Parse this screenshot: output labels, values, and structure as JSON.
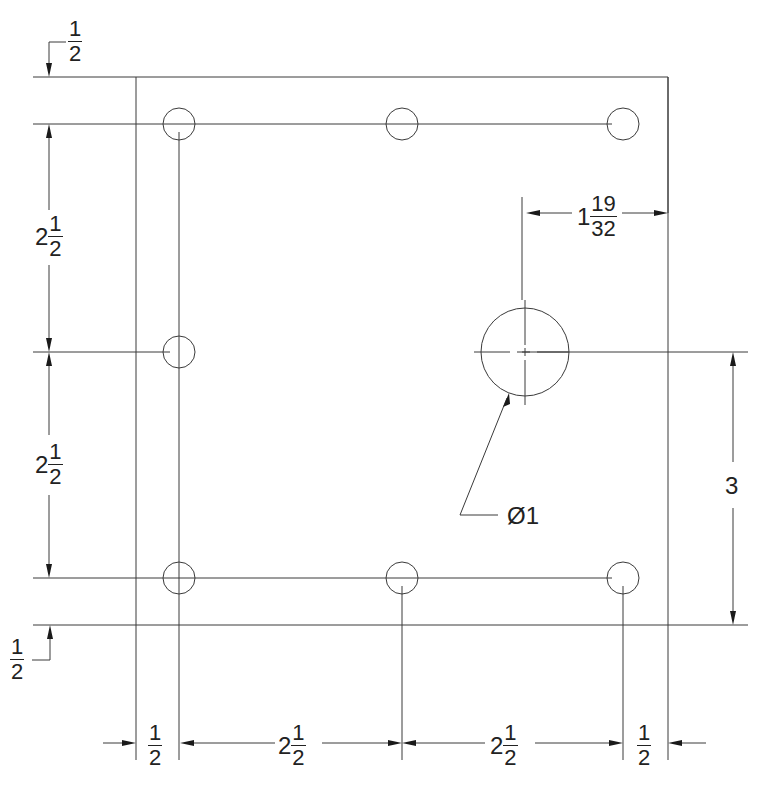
{
  "drawing": {
    "type": "plate-hole-layout",
    "units": "inches",
    "plate": {
      "x": 136,
      "y": 77,
      "w": 532,
      "h": 548
    },
    "small_holes": [
      {
        "cx": 179,
        "cy": 124,
        "r": 16
      },
      {
        "cx": 402,
        "cy": 124,
        "r": 16
      },
      {
        "cx": 623,
        "cy": 124,
        "r": 16
      },
      {
        "cx": 179,
        "cy": 352,
        "r": 16
      },
      {
        "cx": 179,
        "cy": 578,
        "r": 16
      },
      {
        "cx": 402,
        "cy": 578,
        "r": 16
      },
      {
        "cx": 623,
        "cy": 578,
        "r": 16
      }
    ],
    "large_hole": {
      "cx": 525,
      "cy": 352,
      "r": 44
    }
  },
  "dimensions": {
    "top_edge_offset": {
      "num": "1",
      "den": "2"
    },
    "left_upper_spacing": {
      "whole": "2",
      "num": "1",
      "den": "2"
    },
    "left_lower_spacing": {
      "whole": "2",
      "num": "1",
      "den": "2"
    },
    "bottom_edge_offset": {
      "num": "1",
      "den": "2"
    },
    "large_hole_from_right": {
      "whole": "1",
      "num": "19",
      "den": "32"
    },
    "large_hole_height": "3",
    "large_hole_diameter": "Ø1",
    "bottom_left_offset": {
      "num": "1",
      "den": "2"
    },
    "bottom_spacing_1": {
      "whole": "2",
      "num": "1",
      "den": "2"
    },
    "bottom_spacing_2": {
      "whole": "2",
      "num": "1",
      "den": "2"
    },
    "bottom_right_offset": {
      "num": "1",
      "den": "2"
    }
  }
}
